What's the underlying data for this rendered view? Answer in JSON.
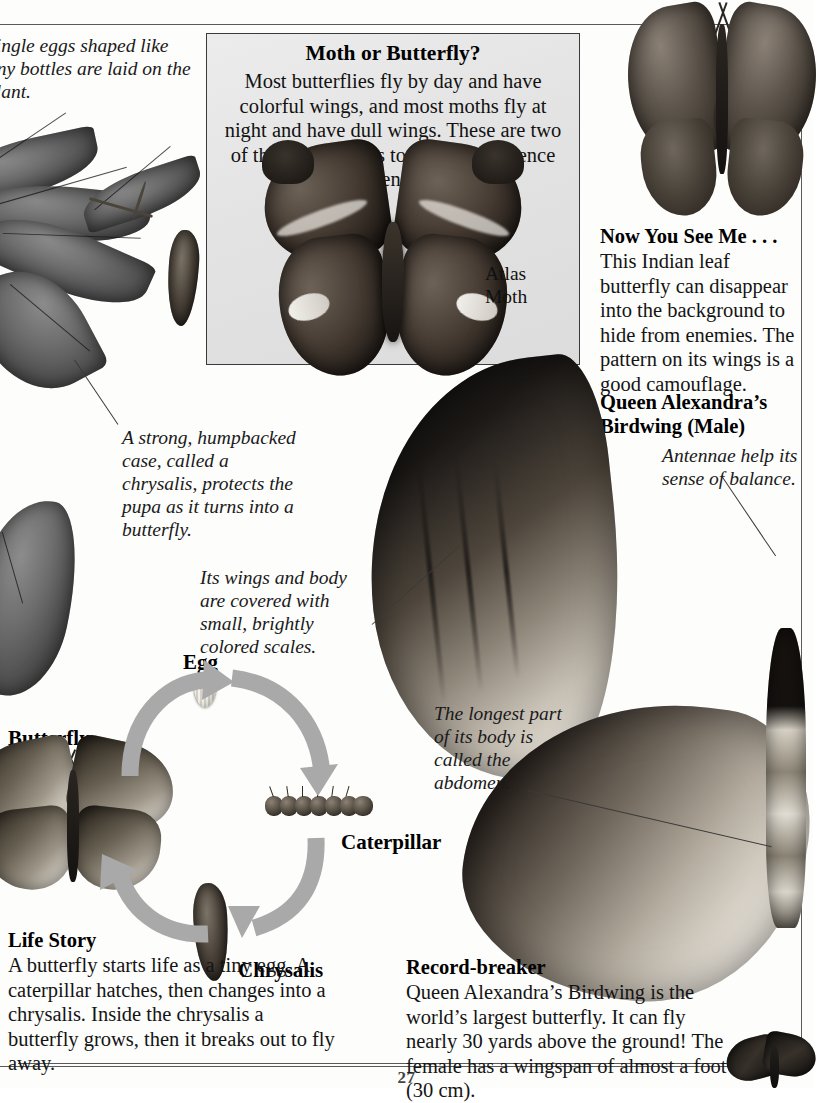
{
  "page": {
    "number": "27"
  },
  "moth_panel": {
    "title": "Moth or Butterfly?",
    "body": "Most butterflies fly by day and have colorful wings, and most moths fly at night and have dull wings. These are two of the easiest ways to tell the difference between them!",
    "specimen_label": "Atlas\nMoth",
    "specimen_label_line1": "Atlas",
    "specimen_label_line2": "Moth",
    "border_color": "#3a3a3a",
    "background_color": "#e6e6e6"
  },
  "captions": {
    "eggs": {
      "text": "Single eggs shaped like tiny bottles are laid on the plant.",
      "style": "italic",
      "clipped_left": true
    },
    "chrysalis": {
      "text": "A strong, humpbacked case, called a chrysalis, protects the pupa as it turns into a butterfly.",
      "style": "italic"
    },
    "scales": {
      "text": "Its wings and body are covered with small, brightly colored scales.",
      "style": "italic"
    },
    "antennae": {
      "text": "Antennae help its sense of balance.",
      "style": "italic"
    },
    "abdomen": {
      "text": "The longest part of its body is called the abdomen.",
      "style": "italic"
    }
  },
  "sections": {
    "now_you_see_me": {
      "heading": "Now You See Me . . .",
      "body": "This Indian leaf butterfly can disappear into the background to hide from enemies. The pattern on its wings is a good camouflage."
    },
    "birdwing": {
      "heading_line1": "Queen Alexandra’s",
      "heading_line2": "Birdwing (Male)"
    },
    "record_breaker": {
      "heading": "Record-breaker",
      "body": "Queen Alexandra’s Birdwing is the world’s largest butterfly. It can fly nearly 30 yards above the ground! The female has a wingspan of almost a foot (30 cm)."
    },
    "life_story": {
      "heading": "Life Story",
      "body": "A butterfly starts life as a tiny egg. A caterpillar hatches, then changes into a chrysalis. Inside the chrysalis a butterfly grows, then it breaks out to fly away."
    }
  },
  "life_cycle": {
    "stages": [
      {
        "label": "Egg"
      },
      {
        "label": "Caterpillar"
      },
      {
        "label": "Chrysalis"
      },
      {
        "label": "Butterfly"
      }
    ],
    "arrow_color": "#a8a8a8"
  }
}
